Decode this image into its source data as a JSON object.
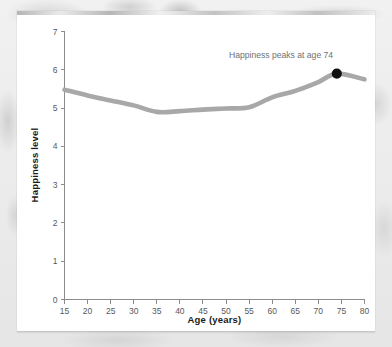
{
  "figure": {
    "background_color": "#ebebeb",
    "card_color": "#ffffff",
    "line_color": "#a8a8a8",
    "marker_color": "#111111",
    "annotation_color": "#6e7174",
    "axis_color": "#8c8c8c"
  },
  "chart_data": {
    "type": "line",
    "title": "",
    "xlabel": "Age (years)",
    "ylabel": "Happiness level",
    "xlim": [
      15,
      80
    ],
    "ylim": [
      0,
      7
    ],
    "xticks": [
      15,
      20,
      25,
      30,
      35,
      40,
      45,
      50,
      55,
      60,
      65,
      70,
      75,
      80
    ],
    "yticks": [
      0,
      1,
      2,
      3,
      4,
      5,
      6,
      7
    ],
    "xtick_labels": [
      "15",
      "20",
      "25",
      "30",
      "35",
      "40",
      "45",
      "50",
      "55",
      "60",
      "65",
      "70",
      "75",
      "80"
    ],
    "ytick_labels": [
      "0",
      "1",
      "2",
      "3",
      "4",
      "5",
      "6",
      "7"
    ],
    "grid": false,
    "legend": false,
    "series": [
      {
        "name": "Happiness level",
        "color": "#a8a8a8",
        "x": [
          15,
          20,
          25,
          30,
          35,
          40,
          45,
          50,
          55,
          60,
          65,
          70,
          74,
          80
        ],
        "values": [
          5.48,
          5.33,
          5.2,
          5.07,
          4.9,
          4.92,
          4.96,
          4.99,
          5.02,
          5.28,
          5.45,
          5.68,
          5.9,
          5.75
        ]
      }
    ],
    "annotations": [
      {
        "text": "Happiness peaks at age 74",
        "x": 74,
        "y": 5.9,
        "marker": true,
        "marker_color": "#111111",
        "text_anchor": "end",
        "text_x": 73.2,
        "text_y": 6.32
      }
    ]
  }
}
